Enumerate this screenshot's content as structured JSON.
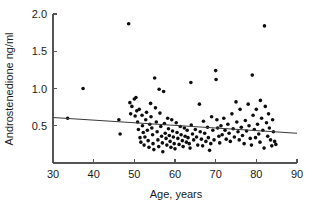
{
  "chart_data": {
    "type": "scatter",
    "title": "",
    "xlabel": "Age, years",
    "ylabel": "Androstenedione ng/ml",
    "xlim": [
      30,
      90
    ],
    "ylim": [
      0.0,
      2.0
    ],
    "xticks": [
      30,
      40,
      50,
      60,
      70,
      80,
      90
    ],
    "xtick_labels": [
      "30",
      "40",
      "50",
      "60",
      "70",
      "80",
      "90"
    ],
    "yticks": [
      0.5,
      1.0,
      1.5,
      2.0
    ],
    "ytick_labels": [
      "0.5",
      "1.0",
      "1.5",
      "2.0"
    ],
    "grid": false,
    "legend": null,
    "marker_color": "#0d0d0d",
    "marker_size_px": 3,
    "trend_line": {
      "label": "linear regression fit",
      "color": "#3a3a3a",
      "x_start": 30,
      "y_start": 0.61,
      "x_end": 90,
      "y_end": 0.4
    },
    "points": [
      [
        33.6,
        0.6
      ],
      [
        37.4,
        1.0
      ],
      [
        46.2,
        0.58
      ],
      [
        46.5,
        0.39
      ],
      [
        48.6,
        1.87
      ],
      [
        48.9,
        0.81
      ],
      [
        49.1,
        0.66
      ],
      [
        49.4,
        0.76
      ],
      [
        50.0,
        0.86
      ],
      [
        50.2,
        0.63
      ],
      [
        50.4,
        0.88
      ],
      [
        50.6,
        0.7
      ],
      [
        50.8,
        0.55
      ],
      [
        51.0,
        0.45
      ],
      [
        51.2,
        0.72
      ],
      [
        51.4,
        0.34
      ],
      [
        51.6,
        0.28
      ],
      [
        51.9,
        0.64
      ],
      [
        52.0,
        0.5
      ],
      [
        52.2,
        0.41
      ],
      [
        52.4,
        0.24
      ],
      [
        52.6,
        0.35
      ],
      [
        52.8,
        0.58
      ],
      [
        53.0,
        0.68
      ],
      [
        53.2,
        0.44
      ],
      [
        53.4,
        0.3
      ],
      [
        53.6,
        0.21
      ],
      [
        53.8,
        0.52
      ],
      [
        54.0,
        0.8
      ],
      [
        54.1,
        0.62
      ],
      [
        54.3,
        0.47
      ],
      [
        54.5,
        0.38
      ],
      [
        54.6,
        0.26
      ],
      [
        54.8,
        0.18
      ],
      [
        55.0,
        1.14
      ],
      [
        55.2,
        0.74
      ],
      [
        55.4,
        0.55
      ],
      [
        55.6,
        0.42
      ],
      [
        55.8,
        0.31
      ],
      [
        56.0,
        0.22
      ],
      [
        56.1,
        0.99
      ],
      [
        56.3,
        0.67
      ],
      [
        56.5,
        0.49
      ],
      [
        56.7,
        0.36
      ],
      [
        56.9,
        0.27
      ],
      [
        57.0,
        0.15
      ],
      [
        57.2,
        0.96
      ],
      [
        57.4,
        0.53
      ],
      [
        57.6,
        0.4
      ],
      [
        57.8,
        0.33
      ],
      [
        58.0,
        0.24
      ],
      [
        58.2,
        0.6
      ],
      [
        58.4,
        0.46
      ],
      [
        58.6,
        0.37
      ],
      [
        58.8,
        0.29
      ],
      [
        59.0,
        0.21
      ],
      [
        59.2,
        0.58
      ],
      [
        59.4,
        0.43
      ],
      [
        59.6,
        0.35
      ],
      [
        59.8,
        0.26
      ],
      [
        60.0,
        0.19
      ],
      [
        60.3,
        0.54
      ],
      [
        60.5,
        0.41
      ],
      [
        60.7,
        0.33
      ],
      [
        61.0,
        0.25
      ],
      [
        61.3,
        0.49
      ],
      [
        61.5,
        0.38
      ],
      [
        61.8,
        0.3
      ],
      [
        62.0,
        0.22
      ],
      [
        62.3,
        0.47
      ],
      [
        62.5,
        0.36
      ],
      [
        62.8,
        0.28
      ],
      [
        63.0,
        0.44
      ],
      [
        63.2,
        0.34
      ],
      [
        63.5,
        0.26
      ],
      [
        63.7,
        0.2
      ],
      [
        63.9,
        1.08
      ],
      [
        64.0,
        0.51
      ],
      [
        64.3,
        0.39
      ],
      [
        64.6,
        0.31
      ],
      [
        65.0,
        0.45
      ],
      [
        65.3,
        0.35
      ],
      [
        65.6,
        0.24
      ],
      [
        66.0,
        0.79
      ],
      [
        66.2,
        0.42
      ],
      [
        66.5,
        0.32
      ],
      [
        66.8,
        0.23
      ],
      [
        67.0,
        0.56
      ],
      [
        67.3,
        0.4
      ],
      [
        67.6,
        0.29
      ],
      [
        68.0,
        0.48
      ],
      [
        68.2,
        0.34
      ],
      [
        68.5,
        0.17
      ],
      [
        68.8,
        0.26
      ],
      [
        69.0,
        0.62
      ],
      [
        69.3,
        0.44
      ],
      [
        69.6,
        0.31
      ],
      [
        70.0,
        1.24
      ],
      [
        70.1,
        1.12
      ],
      [
        70.3,
        0.58
      ],
      [
        70.5,
        0.47
      ],
      [
        70.8,
        0.36
      ],
      [
        71.0,
        0.27
      ],
      [
        71.3,
        0.5
      ],
      [
        71.6,
        0.38
      ],
      [
        72.0,
        0.6
      ],
      [
        72.3,
        0.44
      ],
      [
        72.6,
        0.32
      ],
      [
        73.0,
        0.52
      ],
      [
        73.3,
        0.4
      ],
      [
        73.6,
        0.29
      ],
      [
        74.0,
        0.66
      ],
      [
        74.3,
        0.46
      ],
      [
        74.6,
        0.35
      ],
      [
        75.0,
        0.82
      ],
      [
        75.2,
        0.55
      ],
      [
        75.5,
        0.42
      ],
      [
        75.8,
        0.31
      ],
      [
        76.0,
        0.72
      ],
      [
        76.3,
        0.48
      ],
      [
        76.6,
        0.37
      ],
      [
        77.0,
        0.26
      ],
      [
        77.3,
        0.57
      ],
      [
        77.6,
        0.43
      ],
      [
        78.0,
        0.79
      ],
      [
        78.2,
        0.5
      ],
      [
        78.5,
        0.33
      ],
      [
        78.8,
        0.24
      ],
      [
        79.0,
        1.18
      ],
      [
        79.2,
        0.64
      ],
      [
        79.5,
        0.45
      ],
      [
        79.8,
        0.34
      ],
      [
        80.0,
        0.72
      ],
      [
        80.3,
        0.52
      ],
      [
        80.6,
        0.39
      ],
      [
        80.9,
        0.28
      ],
      [
        81.0,
        0.84
      ],
      [
        81.3,
        0.6
      ],
      [
        81.6,
        0.44
      ],
      [
        81.9,
        0.2
      ],
      [
        82.0,
        1.84
      ],
      [
        82.2,
        0.76
      ],
      [
        82.5,
        0.54
      ],
      [
        82.8,
        0.36
      ],
      [
        83.0,
        0.66
      ],
      [
        83.2,
        0.47
      ],
      [
        83.5,
        0.31
      ],
      [
        83.8,
        0.23
      ],
      [
        84.0,
        0.58
      ],
      [
        84.2,
        0.42
      ],
      [
        84.5,
        0.29
      ],
      [
        84.8,
        0.25
      ]
    ]
  },
  "axes": {
    "y_axis_label": "Androstenedione ng/ml",
    "x_axis_label": "Age, years"
  }
}
